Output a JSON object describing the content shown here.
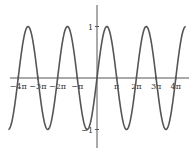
{
  "chart_data": {
    "type": "line",
    "title": "",
    "xlabel": "",
    "ylabel": "",
    "function": "sin(x)",
    "series": [
      {
        "name": "y = sin x",
        "color": "#555555",
        "x_range_pi": [
          -4.5,
          4.5
        ]
      }
    ],
    "xlim_pi": [
      -4.5,
      4.5
    ],
    "ylim": [
      -1.35,
      1.35
    ],
    "x_ticks": [
      {
        "value_pi": -4,
        "label": "−4π"
      },
      {
        "value_pi": -3,
        "label": "−3π"
      },
      {
        "value_pi": -2,
        "label": "−2π"
      },
      {
        "value_pi": -1,
        "label": "−π"
      },
      {
        "value_pi": 1,
        "label": "π"
      },
      {
        "value_pi": 2,
        "label": "2π"
      },
      {
        "value_pi": 3,
        "label": "3π"
      },
      {
        "value_pi": 4,
        "label": "4π"
      }
    ],
    "y_ticks": [
      {
        "value": 1,
        "label": "1"
      },
      {
        "value": -1,
        "label": "−1"
      }
    ],
    "grid": false,
    "legend": "none"
  }
}
